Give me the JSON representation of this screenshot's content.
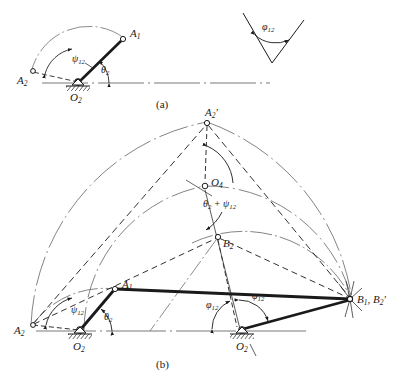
{
  "figure": {
    "type": "engineering-kinematics-diagram",
    "background": "#ffffff",
    "ink_color": "#1a1a1a",
    "width": 400,
    "height": 392
  },
  "captions": {
    "part_a": "(a)",
    "part_b": "(b)"
  },
  "part_a": {
    "name": "crank-rotation-construction",
    "points": [
      {
        "id": "A1",
        "label_html": "A<sub>1</sub>",
        "x": 124,
        "y": 38
      },
      {
        "id": "A2",
        "label_html": "A<sub>2</sub>",
        "x": 31,
        "y": 73
      },
      {
        "id": "O2",
        "label_html": "O<sub>2</sub>",
        "x": 76,
        "y": 84
      }
    ],
    "angles": [
      {
        "id": "psi12",
        "label_html": "&psi;<sub>12</sub>",
        "vertex": "O2"
      },
      {
        "id": "theta2",
        "label_html": "&theta;<sub>2</sub>",
        "vertex": "O2"
      }
    ],
    "detail_angle": {
      "id": "phi12",
      "label_html": "&phi;<sub>12</sub>",
      "vertex_x": 272,
      "vertex_y": 63
    }
  },
  "part_b": {
    "name": "full-linkage-construction",
    "points": [
      {
        "id": "A1",
        "label_html": "A<sub>1</sub>",
        "x": 115,
        "y": 288
      },
      {
        "id": "A2",
        "label_html": "A<sub>2</sub>",
        "x": 31,
        "y": 325
      },
      {
        "id": "A2p",
        "label_html": "A<sub>2</sub>",
        "prime": "&prime;",
        "x": 207,
        "y": 122
      },
      {
        "id": "O2",
        "label_html": "O<sub>2</sub>",
        "x": 81,
        "y": 333
      },
      {
        "id": "O2p",
        "label_html": "O<sub>2</sub>",
        "prime": "&prime;",
        "x": 205,
        "y": 186
      },
      {
        "id": "O4",
        "label_html": "O<sub>4</sub>",
        "x": 243,
        "y": 333
      },
      {
        "id": "B2",
        "label_html": "B<sub>2</sub>",
        "x": 218,
        "y": 236
      },
      {
        "id": "B1B2p",
        "label_html": "B<sub>1</sub>, B<sub>2</sub>",
        "prime": "&prime;",
        "x": 352,
        "y": 300
      }
    ],
    "angles": [
      {
        "id": "psi12",
        "label_html": "&psi;<sub>12</sub>",
        "vertex": "O2"
      },
      {
        "id": "theta2",
        "label_html": "&theta;<sub>2</sub>",
        "vertex": "O2"
      },
      {
        "id": "theta2psi12",
        "label_html": "&theta;<sub>2</sub> + &psi;<sub>12</sub>",
        "vertex": "O2p"
      },
      {
        "id": "phi12_left",
        "label_html": "&phi;<sub>12</sub>",
        "vertex": "O4"
      },
      {
        "id": "phi12_right",
        "label_html": "&phi;<sub>12</sub>",
        "vertex": "O4"
      }
    ]
  }
}
